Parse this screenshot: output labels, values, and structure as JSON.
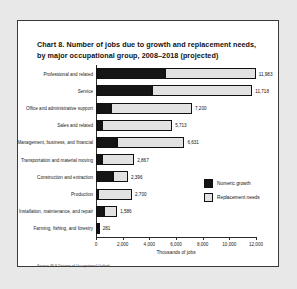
{
  "figure": {
    "title": "Chart 8. Number of jobs due to growth and replacement needs, by major occupational group, 2008–2018 (projected)",
    "source": "Source: BLS Division of Occupational Outlook"
  },
  "chart_data": {
    "type": "bar",
    "orientation": "horizontal",
    "stacked": true,
    "title": "Chart 8. Number of jobs due to growth and replacement needs, by major occupational group, 2008–2018 (projected)",
    "xlabel": "Thousands of jobs",
    "ylabel": "",
    "xlim": [
      0,
      12000
    ],
    "xticks": [
      0,
      2000,
      4000,
      6000,
      8000,
      10000,
      12000
    ],
    "xtick_labels": [
      "0",
      "2,000",
      "4,000",
      "6,000",
      "8,000",
      "10,000",
      "12,000"
    ],
    "grid": false,
    "legend_position": "inside-right",
    "categories": [
      "Professional and related",
      "Service",
      "Office and administrative support",
      "Sales and related",
      "Management, business, and financial",
      "Transportation and material moving",
      "Construction and extraction",
      "Production",
      "Installation, maintenance, and repair",
      "Farming, fishing, and forestry"
    ],
    "series": [
      {
        "name": "Numeric growth",
        "color": "#151515",
        "values": [
          5154,
          4190,
          1160,
          470,
          1550,
          420,
          1250,
          110,
          600,
          20
        ]
      },
      {
        "name": "Replacement needs",
        "color": "#e2e2e2",
        "values": [
          6829,
          7528,
          6040,
          5243,
          5081,
          2447,
          1146,
          2590,
          986,
          261
        ]
      }
    ],
    "totals": [
      11983,
      11718,
      7200,
      5713,
      6631,
      2867,
      2396,
      2700,
      1586,
      281
    ],
    "total_labels": [
      "11,983",
      "11,718",
      "7,200",
      "5,713",
      "6,631",
      "2,867",
      "2,396",
      "2,700",
      "1,586",
      "281"
    ]
  }
}
